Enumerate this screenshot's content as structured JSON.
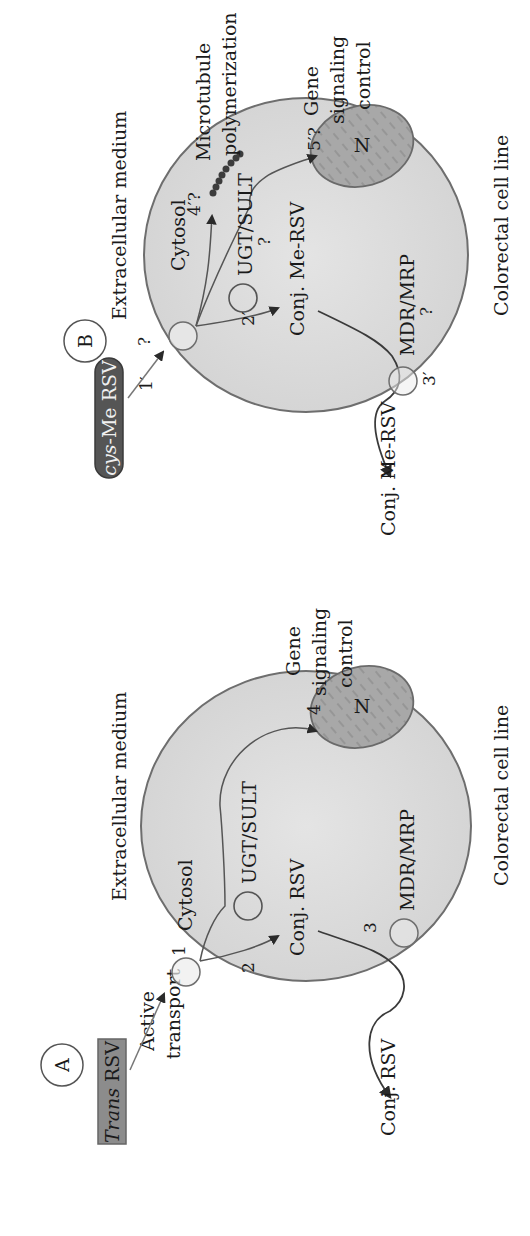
{
  "colors": {
    "cell_fill": "#dcdcdc",
    "cell_stroke": "#6e6e6e",
    "nucleus_fill": "#a9a9a9",
    "nucleus_stroke": "#6a6a6a",
    "trans_box_fill": "#8c8c8c",
    "cys_box_fill": "#555555",
    "arrow": "#3a3a3a",
    "transporter_fill": "#ececec",
    "microtubule": "#3c3c3c"
  },
  "panel_a": {
    "badge": "A",
    "compound_italic": "Trans",
    "compound_rest": " RSV",
    "entry_label_line1": "Active",
    "entry_label_line2": "transport",
    "extracellular": "Extracellular medium",
    "cytosol": "Cytosol",
    "step1": "1",
    "step2": "2",
    "step3": "3",
    "step4": "4",
    "enzyme": "UGT/SULT",
    "conjugate": "Conj. RSV",
    "efflux_transporter": "MDR/MRP",
    "exported": "Conj. RSV",
    "nucleus": "N",
    "gene_line1": "Gene",
    "gene_line2": "signaling",
    "gene_line3": "control",
    "cell_line": "Colorectal cell line"
  },
  "panel_b": {
    "badge": "B",
    "compound_italic": "cys",
    "compound_rest": "-Me RSV",
    "step1": "1′",
    "step1_q": "?",
    "extracellular": "Extracellular medium",
    "cytosol": "Cytosol",
    "step2": "2′",
    "step3": "3′",
    "step4": "4′?",
    "step5": "5′?",
    "enzyme": "UGT/SULT",
    "enzyme_q": "?",
    "conjugate": "Conj. Me-RSV",
    "efflux_transporter": "MDR/MRP",
    "efflux_q": "?",
    "exported": "Conj. Me-RSV",
    "microtubule_line1": "Microtubule",
    "microtubule_line2": "polymerization",
    "nucleus": "N",
    "gene_line1": "Gene",
    "gene_line2": "signaling",
    "gene_line3": "control",
    "cell_line": "Colorectal cell line"
  }
}
